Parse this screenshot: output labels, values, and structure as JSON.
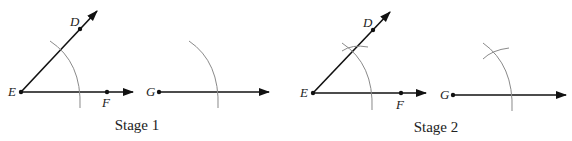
{
  "figure": {
    "colors": {
      "line": "#111111",
      "arc": "#8a8a8a",
      "text": "#222222"
    },
    "stages": [
      {
        "caption": "Stage 1",
        "points": {
          "E": "E",
          "D": "D",
          "F": "F",
          "G": "G"
        }
      },
      {
        "caption": "Stage 2",
        "points": {
          "E": "E",
          "D": "D",
          "F": "F",
          "G": "G"
        }
      }
    ]
  }
}
